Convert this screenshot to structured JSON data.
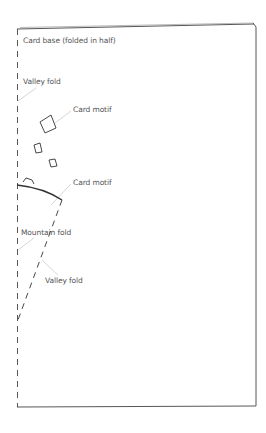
{
  "diagram": {
    "colors": {
      "line": "#333333",
      "leader": "#bbbbbb",
      "text": "#555555",
      "background": "#ffffff"
    },
    "labels": {
      "card_base": "Card base (folded in half)",
      "valley_fold_top": "Valley fold",
      "card_motif_top": "Card motif",
      "card_motif_bottom": "Card motif",
      "mountain_fold": "Mountain fold",
      "valley_fold_bottom": "Valley fold"
    },
    "elements": [
      {
        "id": "card-base",
        "type": "rectangle",
        "edge_left": "dashed (fold)",
        "edges_other": "solid"
      },
      {
        "id": "valley-fold-left",
        "type": "dashed-line",
        "meaning": "valley fold along card spine"
      },
      {
        "id": "motif-large-square",
        "type": "rotated-square"
      },
      {
        "id": "motif-small-square-1",
        "type": "rotated-square"
      },
      {
        "id": "motif-small-square-2",
        "type": "rotated-square"
      },
      {
        "id": "motif-small-shape",
        "type": "partial-square"
      },
      {
        "id": "motif-arc",
        "type": "arc",
        "meaning": "card motif edge"
      },
      {
        "id": "valley-fold-diagonal",
        "type": "dashed-line",
        "meaning": "diagonal valley fold"
      }
    ]
  }
}
